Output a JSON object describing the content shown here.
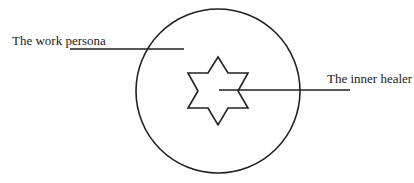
{
  "diagram": {
    "labels": {
      "outer": "The work persona",
      "inner": "The inner healer"
    },
    "shapes": {
      "outer_circle": {
        "cx": 218,
        "cy": 91,
        "r": 82
      },
      "inner_star": {
        "cx": 218,
        "cy": 91,
        "points": 6
      }
    },
    "colors": {
      "stroke": "#222222",
      "background": "#ffffff"
    }
  }
}
